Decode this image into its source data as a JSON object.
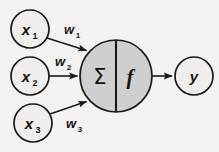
{
  "diagram": {
    "type": "neural-network-neuron",
    "background_color": "#f4f3f1",
    "stroke_color": "#1a1a1a",
    "input_node_fill": "#f0efee",
    "neuron_fill": "#cfcfcf",
    "output_node_fill": "#f0efee",
    "inputs": [
      {
        "id": "x1",
        "base": "x",
        "subscript": "1",
        "cx": 30,
        "cy": 29,
        "r": 19
      },
      {
        "id": "x2",
        "base": "x",
        "subscript": "2",
        "cx": 30,
        "cy": 76,
        "r": 19
      },
      {
        "id": "x3",
        "base": "x",
        "subscript": "3",
        "cx": 33,
        "cy": 123,
        "r": 19
      }
    ],
    "weights": [
      {
        "id": "w1",
        "base": "w",
        "subscript": "1",
        "x": 70,
        "y": 33
      },
      {
        "id": "w2",
        "base": "w",
        "subscript": "2",
        "x": 62,
        "y": 64
      },
      {
        "id": "w3",
        "base": "w",
        "subscript": "3",
        "x": 72,
        "y": 125
      }
    ],
    "neuron": {
      "cx": 116,
      "cy": 76,
      "r": 36,
      "summation_symbol": "Σ",
      "activation_symbol": "f",
      "divider_x": 116
    },
    "output": {
      "id": "y",
      "label": "y",
      "cx": 194,
      "cy": 76,
      "r": 19
    },
    "edges": [
      {
        "from": "x1",
        "to": "neuron",
        "weight": "w1"
      },
      {
        "from": "x2",
        "to": "neuron",
        "weight": "w2"
      },
      {
        "from": "x3",
        "to": "neuron",
        "weight": "w3"
      },
      {
        "from": "neuron",
        "to": "y",
        "weight": null
      }
    ]
  }
}
